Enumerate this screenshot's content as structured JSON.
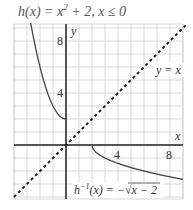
{
  "chart_data": {
    "type": "line",
    "xlabel": "x",
    "ylabel": "y",
    "xlim": [
      -4,
      9
    ],
    "ylim": [
      -4,
      9.3
    ],
    "grid": true,
    "x_ticks": [
      4,
      8
    ],
    "y_ticks": [
      4,
      8
    ],
    "series": [
      {
        "name": "h(x) = x² + 2, x ≤ 0",
        "style": "solid",
        "x": [
          -2.7,
          -2.5,
          -2,
          -1.5,
          -1,
          -0.5,
          0
        ],
        "y": [
          9.29,
          8.25,
          6,
          4.25,
          3,
          2.25,
          2
        ]
      },
      {
        "name": "h⁻¹(x) = −√(x − 2)",
        "style": "solid",
        "x": [
          2,
          2.25,
          3,
          4.25,
          6,
          8.25,
          9
        ],
        "y": [
          0,
          -0.5,
          -1,
          -1.5,
          -2,
          -2.5,
          -2.65
        ]
      },
      {
        "name": "y = x",
        "style": "dashed",
        "x": [
          -4,
          9
        ],
        "y": [
          -4,
          9
        ]
      }
    ],
    "annotations": [
      {
        "text": "y = x",
        "x": 7.2,
        "y": 5.6
      },
      {
        "text": "h⁻¹(x) = −√(x − 2)",
        "x": 1.0,
        "y": -3.4
      }
    ]
  },
  "labels": {
    "title_main": "h(x) = x",
    "title_exp": "2",
    "title_rest": " + 2,  x ≤ 0",
    "x_axis": "x",
    "y_axis": "y",
    "tick_x4": "4",
    "tick_x8": "8",
    "tick_y4": "4",
    "tick_y8": "8",
    "identity": "y = x",
    "inverse_prefix": "h",
    "inverse_exp": "−1",
    "inverse_rest": "(x) = −√x − 2"
  }
}
